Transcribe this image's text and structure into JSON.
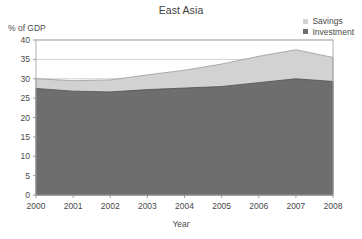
{
  "chart_data": {
    "type": "area",
    "title": "East Asia",
    "xlabel": "Year",
    "ylabel": "% of GDP",
    "categories": [
      "2000",
      "2001",
      "2002",
      "2003",
      "2004",
      "2005",
      "2006",
      "2007",
      "2008"
    ],
    "x": [
      2000,
      2001,
      2002,
      2003,
      2004,
      2005,
      2006,
      2007,
      2008
    ],
    "series": [
      {
        "name": "Savings",
        "color": "#d2d2d2",
        "values": [
          30.0,
          29.5,
          29.7,
          31.0,
          32.2,
          33.8,
          35.8,
          37.5,
          35.5
        ]
      },
      {
        "name": "Investment",
        "color": "#6e6e6e",
        "values": [
          27.5,
          26.8,
          26.6,
          27.2,
          27.6,
          28.0,
          29.0,
          30.0,
          29.3
        ]
      }
    ],
    "ylim": [
      0,
      40
    ],
    "yticks": [
      0,
      5,
      10,
      15,
      20,
      25,
      30,
      35,
      40
    ],
    "ytick_labels": [
      "0",
      "5",
      "10",
      "15",
      "20",
      "25",
      "30",
      "35",
      "40"
    ],
    "xlim": [
      2000,
      2008
    ],
    "grid": true,
    "grid_color": "#bfbfbf",
    "legend_position": "top-right",
    "plot_background": "#ffffff",
    "border_color": "#a8a8a8"
  },
  "legend": {
    "items": [
      {
        "label": "Savings",
        "color": "#d2d2d2"
      },
      {
        "label": "Investment",
        "color": "#6e6e6e"
      }
    ]
  }
}
